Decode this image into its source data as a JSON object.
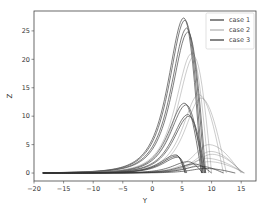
{
  "chart_data": {
    "type": "line",
    "title": "",
    "xlabel": "Y",
    "ylabel": "Z",
    "xlim": [
      -20,
      17.5
    ],
    "ylim": [
      -1.4,
      28.5
    ],
    "xticks": [
      -20,
      -15,
      -10,
      -5,
      0,
      5,
      10,
      15
    ],
    "yticks": [
      0,
      5,
      10,
      15,
      20,
      25
    ],
    "grid": false,
    "legend_position": "upper right",
    "legend": [
      {
        "label": "case 1",
        "color": "#555555",
        "width": 1.4
      },
      {
        "label": "case 2",
        "color": "#777777",
        "width": 0.7
      },
      {
        "label": "case 3",
        "color": "#333333",
        "width": 1.2
      }
    ],
    "x_start": -18.5,
    "series": [
      {
        "name": "case 1",
        "curves": [
          {
            "peak_x": 5.3,
            "peak_z": 27.3,
            "end_x": 8.3
          },
          {
            "peak_x": 5.5,
            "peak_z": 26.9,
            "end_x": 8.5
          },
          {
            "peak_x": 5.8,
            "peak_z": 25.5,
            "end_x": 8.8
          },
          {
            "peak_x": 6.0,
            "peak_z": 24.8,
            "end_x": 9.0
          },
          {
            "peak_x": 5.4,
            "peak_z": 12.3,
            "end_x": 8.3
          },
          {
            "peak_x": 5.7,
            "peak_z": 12.0,
            "end_x": 8.6
          },
          {
            "peak_x": 6.0,
            "peak_z": 10.3,
            "end_x": 8.8
          },
          {
            "peak_x": 6.2,
            "peak_z": 10.0,
            "end_x": 9.0
          }
        ]
      },
      {
        "name": "case 2",
        "curves": [
          {
            "peak_x": 6.6,
            "peak_z": 21.0,
            "end_x": 9.5
          },
          {
            "peak_x": 7.0,
            "peak_z": 20.5,
            "end_x": 10.0
          },
          {
            "peak_x": 7.8,
            "peak_z": 13.8,
            "end_x": 12.0
          },
          {
            "peak_x": 8.2,
            "peak_z": 13.2,
            "end_x": 12.5
          },
          {
            "peak_x": 9.5,
            "peak_z": 5.0,
            "end_x": 15.0
          },
          {
            "peak_x": 9.8,
            "peak_z": 3.8,
            "end_x": 15.2
          },
          {
            "peak_x": 10.0,
            "peak_z": 3.3,
            "end_x": 15.4
          },
          {
            "peak_x": 9.0,
            "peak_z": 2.6,
            "end_x": 15.5
          },
          {
            "peak_x": 9.5,
            "peak_z": 2.0,
            "end_x": 15.6
          }
        ]
      },
      {
        "name": "case 3",
        "curves": [
          {
            "peak_x": 4.0,
            "peak_z": 3.2,
            "end_x": 5.5
          },
          {
            "peak_x": 4.2,
            "peak_z": 3.0,
            "end_x": 5.6
          },
          {
            "peak_x": 4.4,
            "peak_z": 2.8,
            "end_x": 5.8
          },
          {
            "peak_x": 6.0,
            "peak_z": 2.0,
            "end_x": 8.5
          },
          {
            "peak_x": 7.0,
            "peak_z": 1.6,
            "end_x": 10.0
          },
          {
            "peak_x": 8.0,
            "peak_z": 1.2,
            "end_x": 12.0
          },
          {
            "peak_x": 9.0,
            "peak_z": 0.8,
            "end_x": 14.0
          }
        ]
      }
    ]
  }
}
